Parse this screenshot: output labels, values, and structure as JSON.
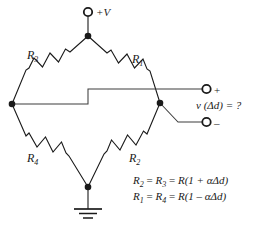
{
  "diagram": {
    "stroke_color": "#1a1a1a",
    "text_color": "#1a1a1a",
    "background": "#ffffff"
  },
  "supply": {
    "terminal_label": "+V",
    "terminal_icon": "open-circle-terminal"
  },
  "resistors": [
    {
      "id": "R3",
      "label": "R",
      "subscript": "3",
      "branch": "top-left"
    },
    {
      "id": "R1",
      "label": "R",
      "subscript": "1",
      "branch": "top-right"
    },
    {
      "id": "R4",
      "label": "R",
      "subscript": "4",
      "branch": "bottom-left"
    },
    {
      "id": "R2",
      "label": "R",
      "subscript": "2",
      "branch": "bottom-right"
    }
  ],
  "output": {
    "plus_label": "+",
    "minus_label": "–",
    "voltage_label": "v (Δd) = ?",
    "plus_icon": "open-circle-terminal",
    "minus_icon": "open-circle-terminal"
  },
  "ground": {
    "icon": "earth-ground-symbol"
  },
  "equations": [
    {
      "id": "eq-r2-r3",
      "lhs_a": "R",
      "lhs_a_sub": "2",
      "lhs_b": "R",
      "lhs_b_sub": "3",
      "rhs": "R(1 + αΔd)",
      "text": "R2 = R3 = R(1 + αΔd)"
    },
    {
      "id": "eq-r1-r4",
      "lhs_a": "R",
      "lhs_a_sub": "1",
      "lhs_b": "R",
      "lhs_b_sub": "4",
      "rhs": "R(1 – αΔd)",
      "text": "R1 = R4 = R(1 - αΔd)"
    }
  ],
  "equals_sign": "=",
  "nodes": [
    {
      "id": "top-node",
      "x": 88,
      "y": 36
    },
    {
      "id": "left-node",
      "x": 12,
      "y": 104
    },
    {
      "id": "right-node",
      "x": 160,
      "y": 103
    },
    {
      "id": "bottom-node",
      "x": 88,
      "y": 187
    }
  ]
}
